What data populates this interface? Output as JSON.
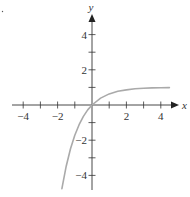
{
  "chart_data": {
    "type": "line",
    "title": "",
    "xlabel": "x",
    "ylabel": "y",
    "xlim": [
      -4.5,
      4.5
    ],
    "ylim": [
      -4.5,
      5
    ],
    "grid": false,
    "legend": null,
    "x_ticks": [
      -4,
      -3,
      -2,
      -1,
      1,
      2,
      3,
      4
    ],
    "x_tick_labels": [
      "−4",
      "−2",
      "2",
      "4"
    ],
    "y_ticks": [
      -4,
      -3,
      -2,
      -1,
      1,
      2,
      3,
      4
    ],
    "y_tick_labels": [
      "4",
      "2",
      "−2",
      "−4"
    ],
    "series": [
      {
        "name": "y = 1 − e^(−x)",
        "color": "#aaaaaa",
        "x": [
          -1.75,
          -1.5,
          -1.25,
          -1,
          -0.75,
          -0.5,
          -0.25,
          0,
          0.5,
          1,
          1.5,
          2,
          2.5,
          3,
          3.5,
          4,
          4.5
        ],
        "y": [
          -4.75,
          -3.48,
          -2.49,
          -1.72,
          -1.12,
          -0.65,
          -0.28,
          0,
          0.39,
          0.63,
          0.78,
          0.86,
          0.92,
          0.95,
          0.97,
          0.98,
          0.99
        ]
      }
    ],
    "annotations": [
      {
        "text": "·",
        "position": "top-left"
      }
    ]
  },
  "labels": {
    "x_axis": "x",
    "y_axis": "y",
    "xt_m4": "−4",
    "xt_m2": "−2",
    "xt_2": "2",
    "xt_4": "4",
    "yt_4": "4",
    "yt_2": "2",
    "yt_m2": "−2",
    "yt_m4": "−4"
  }
}
